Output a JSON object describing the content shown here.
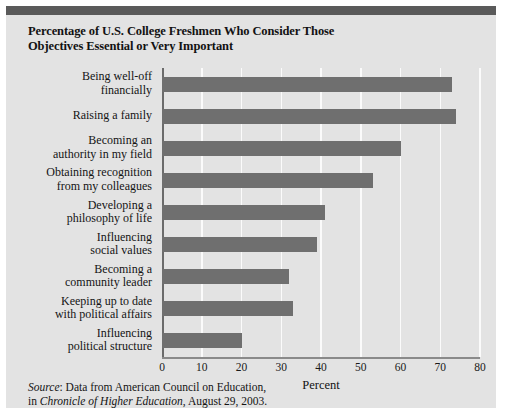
{
  "figure": {
    "title_line1": "Percentage of U.S. College Freshmen Who Consider Those",
    "title_line2": "Objectives Essential or Very Important",
    "source_prefix": "Source",
    "source_line1_rest": ": Data from American Council on Education,",
    "source_line2_a": "in ",
    "source_line2_italic": "Chronicle of Higher Education",
    "source_line2_b": ", August 29, 2003."
  },
  "colors": {
    "bar": "#6f6f6f",
    "panel_background": "#e3e3e3",
    "header_rule": "#5a5a5a",
    "gridline": "#fbfbfb",
    "axis": "#6b6b6b"
  },
  "chart_data": {
    "type": "bar",
    "orientation": "horizontal",
    "title": "Percentage of U.S. College Freshmen Who Consider Those Objectives Essential or Very Important",
    "xlabel": "Percent",
    "ylabel": "",
    "xlim": [
      0,
      80
    ],
    "xticks": [
      0,
      10,
      20,
      30,
      40,
      50,
      60,
      70,
      80
    ],
    "grid": "vertical",
    "legend": "none",
    "categories": [
      "Being well-off financially",
      "Raising a family",
      "Becoming an authority in my field",
      "Obtaining recognition from my colleagues",
      "Developing a philosophy of life",
      "Influencing social values",
      "Becoming a community leader",
      "Keeping up to date with political affairs",
      "Influencing political structure"
    ],
    "category_lines": [
      [
        "Being well-off",
        "financially"
      ],
      [
        "Raising a family"
      ],
      [
        "Becoming an",
        "authority in my field"
      ],
      [
        "Obtaining recognition",
        "from my colleagues"
      ],
      [
        "Developing a",
        "philosophy of life"
      ],
      [
        "Influencing",
        "social values"
      ],
      [
        "Becoming a",
        "community leader"
      ],
      [
        "Keeping up to date",
        "with political affairs"
      ],
      [
        "Influencing",
        "political structure"
      ]
    ],
    "values": [
      73,
      74,
      60,
      53,
      41,
      39,
      32,
      33,
      20
    ]
  }
}
